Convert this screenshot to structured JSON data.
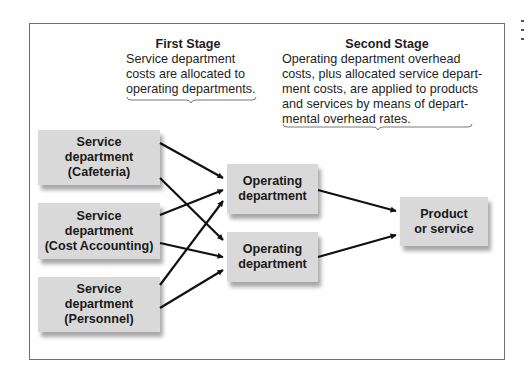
{
  "first_stage": {
    "title": "First Stage",
    "lines": [
      "Service department",
      "costs are allocated to",
      "operating departments."
    ]
  },
  "second_stage": {
    "title": "Second Stage",
    "lines": [
      "Operating department overhead",
      "costs, plus allocated service depart-",
      "ment costs, are applied to products",
      "and services by means of depart-",
      "mental overhead rates."
    ]
  },
  "service_departments": [
    {
      "lines": [
        "Service",
        "department",
        "(Cafeteria)"
      ]
    },
    {
      "lines": [
        "Service",
        "department",
        "(Cost Accounting)"
      ]
    },
    {
      "lines": [
        "Service",
        "department",
        "(Personnel)"
      ]
    }
  ],
  "operating_departments": [
    {
      "lines": [
        "Operating",
        "department"
      ]
    },
    {
      "lines": [
        "Operating",
        "department"
      ]
    }
  ],
  "product": {
    "lines": [
      "Product",
      "or service"
    ]
  },
  "colors": {
    "box_fill": "#d9d9d9",
    "arrow": "#111111",
    "frame": "#6e6e6e"
  }
}
